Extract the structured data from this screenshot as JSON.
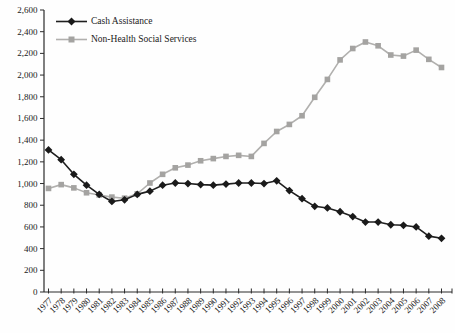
{
  "chart_data": {
    "type": "line",
    "title": "",
    "x_labels": [
      "1977",
      "1978",
      "1979",
      "1980",
      "1981",
      "1982",
      "1983",
      "1984",
      "1985",
      "1986",
      "1987",
      "1988",
      "1989",
      "1990",
      "1991",
      "1992",
      "1993",
      "1994",
      "1995",
      "1996",
      "1997",
      "1998",
      "1999",
      "2000",
      "2001",
      "2002",
      "2003",
      "2004",
      "2005",
      "2006",
      "2007",
      "2008"
    ],
    "series": [
      {
        "name": "Cash Assistance",
        "marker": "diamond",
        "line_color": "#1f1f1f",
        "marker_color": "#1a1a1a",
        "values": [
          1310,
          1220,
          1085,
          985,
          900,
          835,
          850,
          900,
          930,
          985,
          1005,
          1000,
          990,
          985,
          995,
          1005,
          1005,
          1000,
          1025,
          935,
          860,
          790,
          775,
          740,
          695,
          645,
          645,
          620,
          615,
          600,
          515,
          495
        ]
      },
      {
        "name": "Non-Health Social Services",
        "marker": "square",
        "line_color": "#b1b0ae",
        "marker_color": "#a4a3a1",
        "values": [
          955,
          990,
          960,
          915,
          895,
          875,
          865,
          905,
          1005,
          1085,
          1145,
          1170,
          1210,
          1230,
          1250,
          1260,
          1250,
          1370,
          1480,
          1545,
          1625,
          1795,
          1960,
          2140,
          2245,
          2305,
          2270,
          2185,
          2175,
          2230,
          2145,
          2070
        ]
      }
    ],
    "y_axis": {
      "min": 0,
      "max": 2600,
      "step": 200,
      "tick_labels": [
        "0",
        "200",
        "400",
        "600",
        "800",
        "1,000",
        "1,200",
        "1,400",
        "1,600",
        "1,800",
        "2,000",
        "2,200",
        "2,400",
        "2,600"
      ]
    },
    "legend_position": "top-left",
    "grid": false
  },
  "style": {
    "axis_color": "#2b2b2b",
    "text_color": "#1a1a1a",
    "background": "#fefefe"
  }
}
